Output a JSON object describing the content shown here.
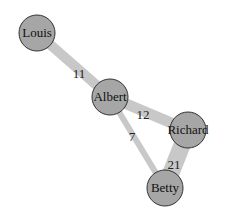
{
  "graph": {
    "node_fill": "#a6a6a6",
    "node_stroke": "#333333",
    "edge_color": "#c8c8c8",
    "nodes": [
      {
        "id": "Louis",
        "label": "Louis",
        "x": 37,
        "y": 33,
        "r": 18
      },
      {
        "id": "Albert",
        "label": "Albert",
        "x": 110,
        "y": 97,
        "r": 18
      },
      {
        "id": "Richard",
        "label": "Richard",
        "x": 188,
        "y": 130,
        "r": 18
      },
      {
        "id": "Betty",
        "label": "Betty",
        "x": 165,
        "y": 188,
        "r": 18
      }
    ],
    "edges": [
      {
        "source": "Louis",
        "target": "Albert",
        "weight": "11",
        "label_x": 79,
        "label_y": 74,
        "width": 10
      },
      {
        "source": "Albert",
        "target": "Richard",
        "weight": "12",
        "label_x": 143,
        "label_y": 115,
        "width": 11
      },
      {
        "source": "Albert",
        "target": "Betty",
        "weight": "7",
        "label_x": 131,
        "label_y": 137,
        "width": 6
      },
      {
        "source": "Richard",
        "target": "Betty",
        "weight": "21",
        "label_x": 174,
        "label_y": 165,
        "width": 17
      }
    ]
  }
}
